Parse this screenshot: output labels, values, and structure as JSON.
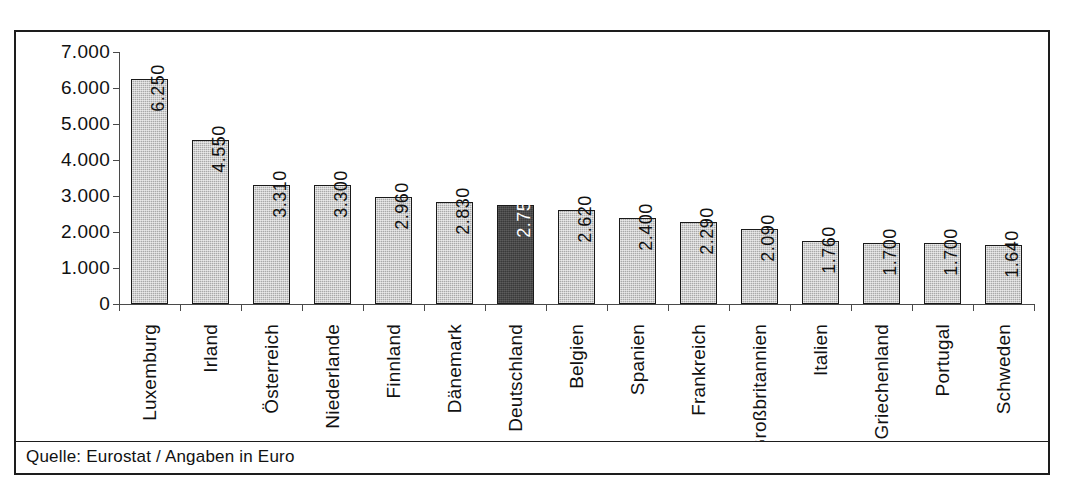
{
  "figure": {
    "source_note": "Quelle: Eurostat / Angaben in Euro",
    "top_fragment": "",
    "bottom_caption": ""
  },
  "chart_data": {
    "type": "bar",
    "title": "",
    "subtitle": "",
    "xlabel": "",
    "ylabel": "",
    "unit": "Euro",
    "source": "Eurostat",
    "grid": false,
    "legend": "none",
    "ylim": [
      0,
      7000
    ],
    "ytick_step": 1000,
    "ytick_labels": [
      "7.000",
      "6.000",
      "5.000",
      "4.000",
      "3.000",
      "2.000",
      "1.000",
      "0"
    ],
    "ytick_values": [
      7000,
      6000,
      5000,
      4000,
      3000,
      2000,
      1000,
      0
    ],
    "categories": [
      "Luxemburg",
      "Irland",
      "Österreich",
      "Niederlande",
      "Finnland",
      "Dänemark",
      "Deutschland",
      "Belgien",
      "Spanien",
      "Frankreich",
      "Großbritannien",
      "Italien",
      "Griechenland",
      "Portugal",
      "Schweden"
    ],
    "values": [
      6250,
      4550,
      3310,
      3300,
      2960,
      2830,
      2750,
      2620,
      2400,
      2290,
      2090,
      1760,
      1700,
      1700,
      1640
    ],
    "value_labels": [
      "6.250",
      "4.550",
      "3.310",
      "3.300",
      "2.960",
      "2.830",
      "2.750",
      "2.620",
      "2.400",
      "2.290",
      "2.090",
      "1.760",
      "1.700",
      "1.700",
      "1.640"
    ],
    "highlight_index": 6,
    "colors": {
      "bar": "#a9a9a9",
      "bar_highlight": "#3a3a3a",
      "bar_border": "#1a1a1a",
      "axis": "#4a4a4a",
      "frame": "#1d1d1d",
      "text": "#111111",
      "highlight_text": "#ffffff",
      "background": "#ffffff"
    }
  }
}
